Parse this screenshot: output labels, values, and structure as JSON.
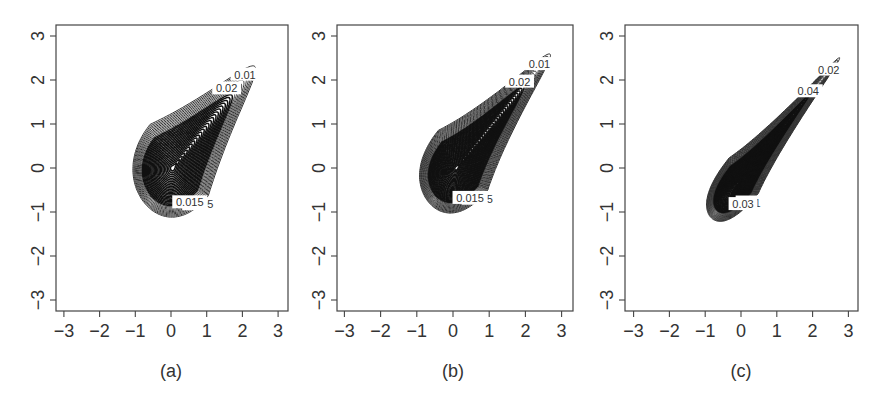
{
  "figure": {
    "panels": [
      {
        "id": "a",
        "caption": "(a)"
      },
      {
        "id": "b",
        "caption": "(b)"
      },
      {
        "id": "c",
        "caption": "(c)"
      }
    ]
  },
  "chart_data": [
    {
      "type": "contour",
      "panel": "(a)",
      "title": "",
      "xlabel": "",
      "ylabel": "",
      "xlim": [
        -3.2,
        3.3
      ],
      "ylim": [
        -3.2,
        3.3
      ],
      "xticks": [
        -3,
        -2,
        -1,
        0,
        1,
        2,
        3
      ],
      "yticks": [
        -3,
        -2,
        -1,
        0,
        1,
        2,
        3
      ],
      "grid": false,
      "mode": [
        0.05,
        0.0
      ],
      "shape": "teardrop, tip toward upper-right (≈2.7, 2.7), broad base lower-left",
      "contour_labels": [
        "0.005",
        "0.01",
        "0.015",
        "0.02",
        "0.025",
        "0.03",
        "0.035",
        "0.04",
        "0.045",
        "0.05",
        "0.075",
        "0.08",
        "0.09",
        "0.1",
        "0.11",
        "0.13",
        "0.14"
      ],
      "geometry": {
        "cx": 0.05,
        "cy": 0.0,
        "elong": 0.55,
        "taper": 1.25,
        "rmax": 2.55,
        "levels": 34,
        "aspect": 1.0
      }
    },
    {
      "type": "contour",
      "panel": "(b)",
      "title": "",
      "xlabel": "",
      "ylabel": "",
      "xlim": [
        -3.2,
        3.3
      ],
      "ylim": [
        -3.2,
        3.3
      ],
      "xticks": [
        -3,
        -2,
        -1,
        0,
        1,
        2,
        3
      ],
      "yticks": [
        -3,
        -2,
        -1,
        0,
        1,
        2,
        3
      ],
      "grid": false,
      "mode": [
        0.15,
        0.05
      ],
      "shape": "narrower teardrop, tip toward upper-right (≈3, 2.9)",
      "contour_labels": [
        "0.005",
        "0.01",
        "0.015",
        "0.02",
        "0.025",
        "0.03",
        "0.04",
        "0.05",
        "0.06"
      ],
      "geometry": {
        "cx": 0.1,
        "cy": 0.0,
        "elong": 0.68,
        "taper": 1.45,
        "rmax": 2.6,
        "levels": 44,
        "aspect": 0.82
      }
    },
    {
      "type": "contour",
      "panel": "(c)",
      "title": "",
      "xlabel": "",
      "ylabel": "",
      "xlim": [
        -3.2,
        3.3
      ],
      "ylim": [
        -3.2,
        3.3
      ],
      "xticks": [
        -3,
        -2,
        -1,
        0,
        1,
        2,
        3
      ],
      "yticks": [
        -3,
        -2,
        -1,
        0,
        1,
        2,
        3
      ],
      "grid": false,
      "mode": [
        0.0,
        -0.3
      ],
      "shape": "very narrow elongated teardrop along diagonal, tip at (≈3, 3)",
      "contour_labels": [
        "0.01",
        "0.02",
        "0.03",
        "0.04"
      ],
      "geometry": {
        "cx": -0.1,
        "cy": -0.35,
        "elong": 0.8,
        "taper": 1.7,
        "rmax": 2.65,
        "levels": 48,
        "aspect": 0.48
      }
    }
  ]
}
